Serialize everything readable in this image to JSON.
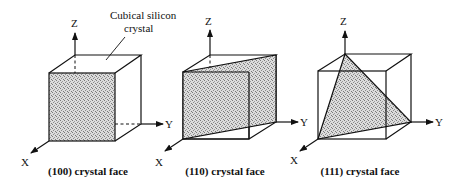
{
  "annotation": {
    "line1": "Cubical silicon",
    "line2": "crystal"
  },
  "colors": {
    "line": "#111111",
    "shade_bg": "#d9d9d9",
    "shade_dot": "#7a7a7a",
    "background": "#ffffff"
  },
  "panels": [
    {
      "id": "100",
      "caption": "(100) crystal face",
      "axes": {
        "x": "X",
        "y": "Y",
        "z": "Z"
      }
    },
    {
      "id": "110",
      "caption": "(110) crystal face",
      "axes": {
        "x": "X",
        "y": "Y",
        "z": "Z"
      }
    },
    {
      "id": "111",
      "caption": "(111) crystal face",
      "axes": {
        "x": "X",
        "y": "Y",
        "z": "Z"
      }
    }
  ]
}
